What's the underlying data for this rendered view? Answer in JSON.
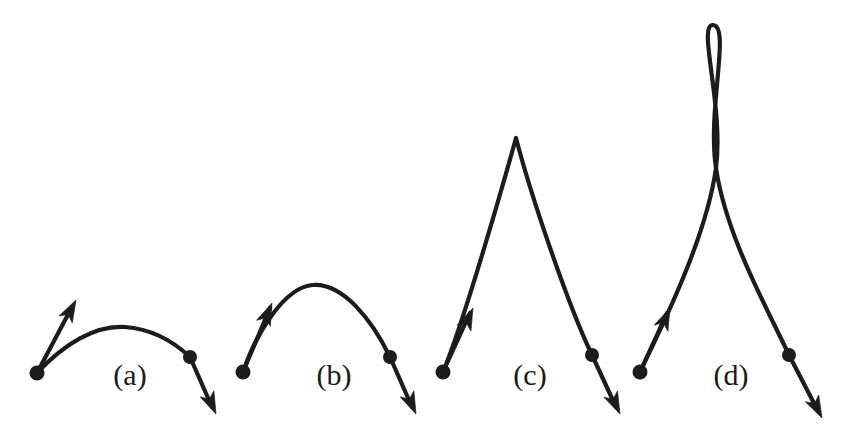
{
  "figure": {
    "background_color": "#ffffff",
    "ink_color": "#1c1c1c",
    "label_color": "#1a1a1a",
    "width": 853,
    "height": 444,
    "stroke_width": 4.2
  },
  "panels": [
    {
      "id": "a",
      "label": "(a)",
      "label_x": 130,
      "label_y": 385,
      "start_point": {
        "x": 37,
        "y": 373
      },
      "end_point": {
        "x": 190,
        "y": 357
      },
      "start_tangent_tip": {
        "x": 76,
        "y": 300
      },
      "end_tangent_tip": {
        "x": 216,
        "y": 414
      },
      "apex": {
        "x": 120,
        "y": 327
      },
      "curve": "M37,373 C64,344 95,325 125,327 C152,329 174,342 190,357",
      "start_tangent": "M37,373 L72,307",
      "end_tangent": "M190,357 L212,407",
      "start_arrow_angle_deg": -62,
      "end_arrow_angle_deg": 66,
      "knots": [
        {
          "x": 37,
          "y": 373,
          "r": 7.5
        },
        {
          "x": 190,
          "y": 357,
          "r": 7.0
        }
      ]
    },
    {
      "id": "b",
      "label": "(b)",
      "label_x": 334,
      "label_y": 385,
      "start_point": {
        "x": 243,
        "y": 372
      },
      "end_point": {
        "x": 390,
        "y": 357
      },
      "start_tangent_tip": {
        "x": 272,
        "y": 303
      },
      "end_tangent_tip": {
        "x": 416,
        "y": 414
      },
      "apex": {
        "x": 313,
        "y": 285
      },
      "curve": "M243,372 C256,334 284,287 313,285 C343,283 372,320 390,357",
      "start_tangent": "M243,372 L270,308",
      "end_tangent": "M390,357 L412,407",
      "start_arrow_angle_deg": -67,
      "end_arrow_angle_deg": 66,
      "knots": [
        {
          "x": 243,
          "y": 372,
          "r": 7.5
        },
        {
          "x": 390,
          "y": 357,
          "r": 7.0
        }
      ]
    },
    {
      "id": "c",
      "label": "(c)",
      "label_x": 530,
      "label_y": 385,
      "start_point": {
        "x": 443,
        "y": 372
      },
      "end_point": {
        "x": 592,
        "y": 355
      },
      "start_tangent_tip": {
        "x": 473,
        "y": 308
      },
      "end_tangent_tip": {
        "x": 620,
        "y": 414
      },
      "apex": {
        "x": 516,
        "y": 138
      },
      "curve": "M443,372 C462,327 500,196 516,138 C531,196 568,305 592,355",
      "start_tangent": "M443,372 L470,313",
      "end_tangent": "M592,355 L616,407",
      "start_arrow_angle_deg": -66,
      "end_arrow_angle_deg": 65,
      "knots": [
        {
          "x": 443,
          "y": 372,
          "r": 7.5
        },
        {
          "x": 592,
          "y": 355,
          "r": 7.0
        }
      ]
    },
    {
      "id": "d",
      "label": "(d)",
      "label_x": 731,
      "label_y": 385,
      "start_point": {
        "x": 640,
        "y": 372
      },
      "end_point": {
        "x": 789,
        "y": 355
      },
      "start_tangent_tip": {
        "x": 670,
        "y": 308
      },
      "end_tangent_tip": {
        "x": 822,
        "y": 418
      },
      "loop_top": {
        "x": 713,
        "y": 25
      },
      "loop_crossing": {
        "x": 716,
        "y": 168
      },
      "curve": "M640,372 C660,330 706,240 716,168 C724,106 697,24 713,25 C731,26 707,110 716,168 C726,236 768,310 789,355",
      "start_tangent": "M640,372 L667,313",
      "end_tangent": "M789,355 L818,411",
      "start_arrow_angle_deg": -66,
      "end_arrow_angle_deg": 63,
      "knots": [
        {
          "x": 640,
          "y": 372,
          "r": 7.5
        },
        {
          "x": 789,
          "y": 355,
          "r": 7.0
        }
      ]
    }
  ],
  "chart_data": {
    "type": "line",
    "xlabel": "",
    "ylabel": "",
    "grid": false,
    "legend": "none",
    "xlim": [
      0,
      853
    ],
    "ylim": [
      444,
      0
    ],
    "annotations": [
      "(a)",
      "(b)",
      "(c)",
      "(d)"
    ],
    "series": [
      {
        "name": "(a)",
        "description": "Shallow arch; short tangent vectors at both endpoints",
        "control_points": [
          [
            37,
            373
          ],
          [
            64,
            344
          ],
          [
            95,
            325
          ],
          [
            125,
            327
          ],
          [
            152,
            329
          ],
          [
            174,
            342
          ],
          [
            190,
            357
          ]
        ],
        "endpoints": [
          [
            37,
            373
          ],
          [
            190,
            357
          ]
        ],
        "tangent_vectors": [
          [
            39,
            -73
          ],
          [
            26,
            57
          ]
        ],
        "apex": [
          120,
          327
        ],
        "peak_height_px": 46
      },
      {
        "name": "(b)",
        "description": "Rounded arch; medium tangent vectors",
        "control_points": [
          [
            243,
            372
          ],
          [
            256,
            334
          ],
          [
            284,
            287
          ],
          [
            313,
            285
          ],
          [
            343,
            283
          ],
          [
            372,
            320
          ],
          [
            390,
            357
          ]
        ],
        "endpoints": [
          [
            243,
            372
          ],
          [
            390,
            357
          ]
        ],
        "tangent_vectors": [
          [
            29,
            -69
          ],
          [
            26,
            57
          ]
        ],
        "apex": [
          313,
          285
        ],
        "peak_height_px": 87
      },
      {
        "name": "(c)",
        "description": "Sharp cusp apex; long tangent vectors",
        "control_points": [
          [
            443,
            372
          ],
          [
            462,
            327
          ],
          [
            500,
            196
          ],
          [
            516,
            138
          ],
          [
            531,
            196
          ],
          [
            568,
            305
          ],
          [
            592,
            355
          ]
        ],
        "endpoints": [
          [
            443,
            372
          ],
          [
            592,
            355
          ]
        ],
        "tangent_vectors": [
          [
            30,
            -64
          ],
          [
            28,
            59
          ]
        ],
        "apex": [
          516,
          138
        ],
        "peak_height_px": 234
      },
      {
        "name": "(d)",
        "description": "Self-intersecting loop at top; very long tangent vectors",
        "control_points": [
          [
            640,
            372
          ],
          [
            660,
            330
          ],
          [
            706,
            240
          ],
          [
            716,
            168
          ],
          [
            724,
            106
          ],
          [
            697,
            24
          ],
          [
            713,
            25
          ],
          [
            731,
            26
          ],
          [
            707,
            110
          ],
          [
            716,
            168
          ],
          [
            726,
            236
          ],
          [
            768,
            310
          ],
          [
            789,
            355
          ]
        ],
        "endpoints": [
          [
            640,
            372
          ],
          [
            789,
            355
          ]
        ],
        "tangent_vectors": [
          [
            30,
            -64
          ],
          [
            33,
            63
          ]
        ],
        "apex": [
          713,
          25
        ],
        "loop_crossing": [
          716,
          168
        ],
        "peak_height_px": 347
      }
    ]
  }
}
